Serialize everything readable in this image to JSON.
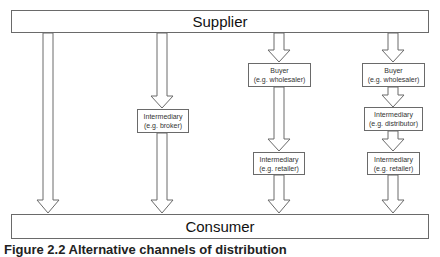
{
  "diagram": {
    "top": {
      "label": "Supplier"
    },
    "bottom": {
      "label": "Consumer"
    },
    "channels": [
      {
        "id": "direct",
        "nodes": []
      },
      {
        "id": "broker",
        "nodes": [
          {
            "title": "Intermediary",
            "example": "(e.g. broker)"
          }
        ]
      },
      {
        "id": "wholesaler-retailer",
        "nodes": [
          {
            "title": "Buyer",
            "example": "(e.g. wholesaler)"
          },
          {
            "title": "Intermediary",
            "example": "(e.g. retailer)"
          }
        ]
      },
      {
        "id": "wholesaler-distributor-retailer",
        "nodes": [
          {
            "title": "Buyer",
            "example": "(e.g. wholesaler)"
          },
          {
            "title": "Intermediary",
            "example": "(e.g. distributor)"
          },
          {
            "title": "Intermediary",
            "example": "(e.g. retailer)"
          }
        ]
      }
    ],
    "caption": "Figure 2.2   Alternative channels of distribution"
  },
  "colors": {
    "stroke": "#6a6a6a",
    "background": "#ffffff",
    "text": "#222222"
  }
}
